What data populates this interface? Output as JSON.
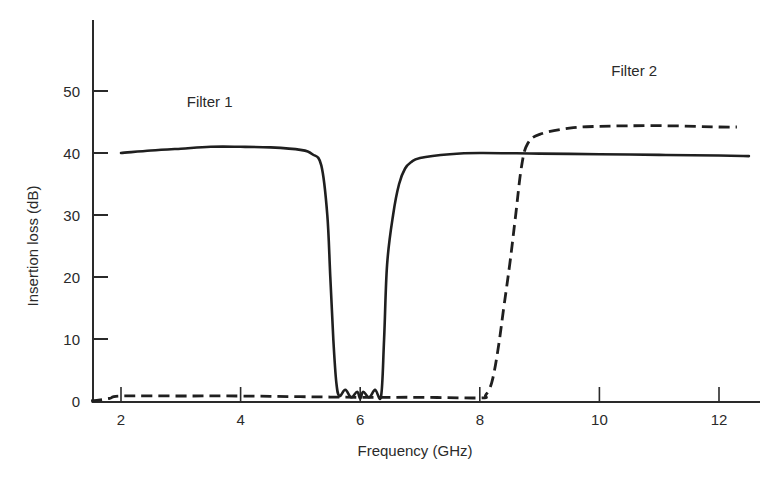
{
  "chart_data": {
    "type": "line",
    "title": "",
    "xlabel": "Frequency (GHz)",
    "ylabel": "Insertion loss (dB)",
    "xlim": [
      1.5,
      12.7
    ],
    "ylim": [
      0,
      60
    ],
    "xticks": [
      2,
      4,
      6,
      8,
      10,
      12
    ],
    "yticks": [
      0,
      10,
      20,
      30,
      40,
      50
    ],
    "grid": false,
    "legend": "inline annotations",
    "series": [
      {
        "name": "Filter 1",
        "style": "solid",
        "label_position": {
          "x": 3.1,
          "y": 47.5
        },
        "x": [
          2.0,
          2.5,
          3.0,
          3.5,
          4.0,
          4.5,
          5.0,
          5.2,
          5.35,
          5.45,
          5.5,
          5.55,
          5.6,
          5.65,
          5.75,
          5.85,
          5.95,
          6.0,
          6.05,
          6.15,
          6.25,
          6.35,
          6.4,
          6.45,
          6.55,
          6.65,
          6.75,
          6.85,
          7.0,
          7.5,
          8.0,
          9.0,
          10.0,
          11.0,
          12.0,
          12.5
        ],
        "values": [
          40.0,
          40.4,
          40.7,
          41.0,
          41.0,
          40.9,
          40.5,
          39.8,
          38.0,
          30.0,
          20.0,
          10.0,
          3.0,
          0.8,
          1.8,
          0.6,
          1.5,
          0.4,
          1.5,
          0.6,
          1.8,
          0.8,
          10.0,
          22.0,
          30.0,
          35.0,
          37.5,
          38.5,
          39.2,
          39.8,
          40.0,
          39.9,
          39.8,
          39.7,
          39.6,
          39.5
        ]
      },
      {
        "name": "Filter 2",
        "style": "dashed",
        "label_position": {
          "x": 10.2,
          "y": 52.5
        },
        "x": [
          1.5,
          1.8,
          2.0,
          3.0,
          4.0,
          5.0,
          6.0,
          7.0,
          8.0,
          8.1,
          8.2,
          8.3,
          8.4,
          8.5,
          8.6,
          8.7,
          8.8,
          9.0,
          9.5,
          10.0,
          11.0,
          12.0,
          12.3
        ],
        "values": [
          0.0,
          0.4,
          0.8,
          0.8,
          0.8,
          0.7,
          0.6,
          0.6,
          0.5,
          1.0,
          3.0,
          8.0,
          15.0,
          22.0,
          30.0,
          38.0,
          41.5,
          43.0,
          44.0,
          44.3,
          44.4,
          44.2,
          44.2
        ]
      }
    ],
    "annotations": [
      "Filter 1",
      "Filter 2"
    ]
  },
  "axes": {
    "x_title": "Frequency (GHz)",
    "y_title": "Insertion loss (dB)",
    "x_tick_labels": [
      "2",
      "4",
      "6",
      "8",
      "10",
      "12"
    ],
    "y_tick_labels": [
      "0",
      "10",
      "20",
      "30",
      "40",
      "50"
    ]
  },
  "labels": {
    "filter1": "Filter 1",
    "filter2": "Filter 2"
  },
  "colors": {
    "line": "#1f1f1f",
    "axis": "#2a2a2a",
    "background": "#ffffff"
  }
}
